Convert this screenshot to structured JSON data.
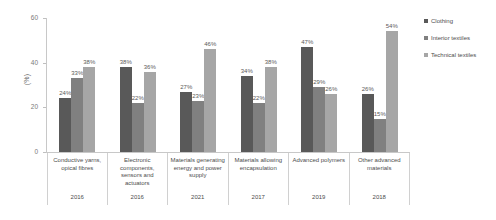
{
  "chart_data": {
    "type": "bar",
    "title": "",
    "xlabel": "",
    "ylabel": "(%)",
    "ylim": [
      0,
      60
    ],
    "yticks": [
      "0",
      "20",
      "40",
      "60"
    ],
    "grid": false,
    "legend_position": "right",
    "categories": [
      "Conductive yarns, opical fibres",
      "Electronic components, sensors and actuators",
      "Materials generating energy and power supply",
      "Materials allowing encapsulation",
      "Advanced polymers",
      "Other advanced materials"
    ],
    "category_years": [
      "2016",
      "2016",
      "2021",
      "2017",
      "2019",
      "2018"
    ],
    "series": [
      {
        "name": "Clothing",
        "color": "#595959",
        "values": [
          24,
          38,
          27,
          34,
          47,
          26
        ],
        "labels": [
          "24%",
          "38%",
          "27%",
          "34%",
          "47%",
          "26%"
        ]
      },
      {
        "name": "Interior textiles",
        "color": "#808080",
        "values": [
          33,
          22,
          23,
          22,
          29,
          15
        ],
        "labels": [
          "33%",
          "22%",
          "23%",
          "22%",
          "29%",
          "15%"
        ]
      },
      {
        "name": "Technical textiles",
        "color": "#a6a6a6",
        "values": [
          38,
          36,
          46,
          38,
          26,
          54
        ],
        "labels": [
          "38%",
          "36%",
          "46%",
          "38%",
          "26%",
          "54%"
        ]
      }
    ]
  }
}
